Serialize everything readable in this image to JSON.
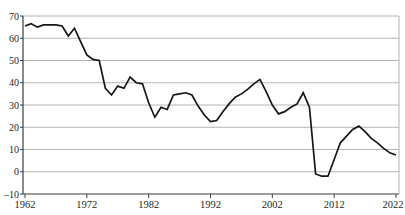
{
  "figure": {
    "background_color": "#ffffff"
  },
  "chart_data": {
    "type": "line",
    "title": "",
    "xlabel": "",
    "ylabel": "",
    "legend_position": "none",
    "grid": "horizontal",
    "x_start": 1962,
    "x_end": 2022,
    "x_step": 1,
    "x_tick_years": [
      1962,
      1972,
      1982,
      1992,
      2002,
      2012,
      2022
    ],
    "x_tick_labels": [
      "1962",
      "1972",
      "1982",
      "1992",
      "2002",
      "2012",
      "2022"
    ],
    "ylim": [
      -10,
      70
    ],
    "y_ticks": [
      -10,
      0,
      10,
      20,
      30,
      40,
      50,
      60,
      70
    ],
    "y_tick_labels": [
      "–10",
      "0",
      "10",
      "20",
      "30",
      "40",
      "50",
      "60",
      "70"
    ],
    "line_color": "#161616",
    "gridline_color": "#b4b4b4",
    "axis_color": "#3c3c3c",
    "label_color": "#1f1f1f",
    "series": [
      {
        "name": "value",
        "values": [
          65.5,
          66.5,
          65,
          66,
          66,
          66,
          65.5,
          61,
          64.5,
          58.5,
          52.5,
          50.5,
          50,
          37.5,
          34.5,
          38.5,
          37.5,
          42.5,
          40,
          39.5,
          31,
          24.5,
          29,
          28,
          34.5,
          35,
          35.5,
          34.5,
          29.5,
          25.5,
          22.5,
          23,
          27,
          30.5,
          33.5,
          35,
          37,
          39.5,
          41.5,
          36,
          30,
          26,
          27,
          29,
          30.5,
          35.5,
          29,
          -1,
          -2,
          -2,
          5.5,
          13,
          16,
          19,
          20.5,
          18,
          15,
          13,
          10.5,
          8.5,
          7.5
        ]
      }
    ]
  }
}
